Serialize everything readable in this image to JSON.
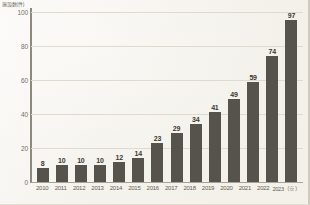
{
  "chart_data": {
    "type": "bar",
    "title": "",
    "xlabel": "",
    "ylabel": "施設数(件)",
    "ylim": [
      0,
      100
    ],
    "y_ticks": [
      100,
      80,
      60,
      40,
      20,
      0
    ],
    "grid": true,
    "legend": "none",
    "categories": [
      "2010",
      "2011",
      "2012",
      "2013",
      "2014",
      "2015",
      "2016",
      "2017",
      "2018",
      "2019",
      "2020",
      "2021",
      "2022",
      "2023（※）"
    ],
    "values": [
      8,
      10,
      10,
      10,
      12,
      14,
      23,
      29,
      34,
      41,
      49,
      59,
      74,
      97
    ],
    "value_labels": [
      "8",
      "10",
      "10",
      "10",
      "12",
      "14",
      "23",
      "29",
      "34",
      "41",
      "49",
      "59",
      "74",
      "97"
    ],
    "colors": {
      "bar": "#56534c",
      "background": "#f4f2ec",
      "gridline": "#dedacd",
      "axis": "#8d897e",
      "text": "#5f5c54"
    }
  }
}
